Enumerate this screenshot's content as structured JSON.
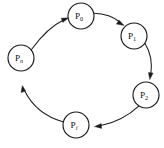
{
  "diagram": {
    "type": "directed-cycle-graph",
    "canvas": {
      "width": 164,
      "height": 148,
      "background": "#ffffff"
    },
    "style": {
      "stroke": "#1a1a1a",
      "node_fill": "#ffffff",
      "node_radius": 13
    },
    "nodes": [
      {
        "id": "p0",
        "base": "P",
        "sub": "0",
        "sub_style": "normal",
        "cx": 81,
        "cy": 16,
        "r": 13
      },
      {
        "id": "p1",
        "base": "P",
        "sub": "1",
        "sub_style": "normal",
        "cx": 134,
        "cy": 36,
        "r": 13
      },
      {
        "id": "p2",
        "base": "P",
        "sub": "2",
        "sub_style": "normal",
        "cx": 146,
        "cy": 95,
        "r": 13
      },
      {
        "id": "pi",
        "base": "P",
        "sub": "i",
        "sub_style": "italic",
        "cx": 76,
        "cy": 125,
        "r": 13
      },
      {
        "id": "pn",
        "base": "P",
        "sub": "n",
        "sub_style": "italic",
        "cx": 21,
        "cy": 58,
        "r": 13
      }
    ],
    "edges": [
      {
        "id": "e-pn-p0",
        "from": "pn",
        "to": "p0",
        "label": ""
      },
      {
        "id": "e-p0-p1",
        "from": "p0",
        "to": "p1",
        "label": ""
      },
      {
        "id": "e-p1-p2",
        "from": "p1",
        "to": "p2",
        "label": ""
      },
      {
        "id": "e-p2-pi",
        "from": "p2",
        "to": "pi",
        "label": ""
      },
      {
        "id": "e-pi-pn",
        "from": "pi",
        "to": "pn",
        "label": ""
      }
    ]
  }
}
